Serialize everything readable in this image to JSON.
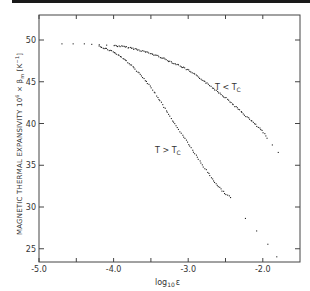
{
  "chart_data": {
    "type": "scatter",
    "title": "",
    "xlabel": "log10 ε",
    "ylabel": "MAGNETIC THERMAL EXPANSIVITY 10^6 × βm [K^-1]",
    "xlim": [
      -5.0,
      -1.5
    ],
    "ylim": [
      23.5,
      53
    ],
    "x_ticks": [
      -5.0,
      -4.5,
      -4.0,
      -3.5,
      -3.0,
      -2.5,
      -2.0
    ],
    "x_tick_labels": [
      "-5.0",
      "-4.0",
      "-3.0",
      "-2.0"
    ],
    "y_ticks": [
      25,
      30,
      35,
      40,
      45,
      50
    ],
    "y_tick_labels": [
      "25",
      "30",
      "35",
      "40",
      "45",
      "50"
    ],
    "grid": false,
    "legend": "inline annotations",
    "series": [
      {
        "name": "T < Tc",
        "label_pos": [
          -2.35,
          46.3
        ],
        "x": [
          -4.7,
          -4.55,
          -4.4,
          -4.3,
          -4.2,
          -4.1,
          -4.0,
          -3.9,
          -3.8,
          -3.7,
          -3.6,
          -3.5,
          -3.4,
          -3.3,
          -3.2,
          -3.1,
          -3.0,
          -2.9,
          -2.8,
          -2.7,
          -2.6,
          -2.5,
          -2.4,
          -2.3,
          -2.2,
          -2.1,
          -2.0,
          -1.95,
          -1.88,
          -1.8
        ],
        "y": [
          49.6,
          49.6,
          49.6,
          49.55,
          49.5,
          49.45,
          49.4,
          49.3,
          49.15,
          48.95,
          48.7,
          48.4,
          48.1,
          47.7,
          47.3,
          46.9,
          46.4,
          45.8,
          45.2,
          44.5,
          43.8,
          43.1,
          42.3,
          41.5,
          40.7,
          39.9,
          39.0,
          38.3,
          37.5,
          36.6
        ]
      },
      {
        "name": "T > Tc",
        "label_pos": [
          -3.28,
          38.7
        ],
        "x": [
          -4.2,
          -4.1,
          -4.0,
          -3.9,
          -3.8,
          -3.7,
          -3.6,
          -3.5,
          -3.4,
          -3.3,
          -3.2,
          -3.1,
          -3.0,
          -2.9,
          -2.8,
          -2.7,
          -2.6,
          -2.5,
          -2.44,
          -2.24,
          -2.09,
          -1.94,
          -1.82
        ],
        "y": [
          49.3,
          49.0,
          48.6,
          48.0,
          47.3,
          46.4,
          45.4,
          44.3,
          43.0,
          41.6,
          40.2,
          38.9,
          37.6,
          36.2,
          34.9,
          33.6,
          32.5,
          31.6,
          31.2,
          28.7,
          27.2,
          25.6,
          24.1
        ]
      }
    ]
  },
  "axes": {
    "x_title_main": "log",
    "x_title_sub": "10",
    "x_title_var": "ε",
    "y_title": "MAGNETIC  THERMAL  EXPANSIVITY  10",
    "y_title_exp": "6",
    "y_title_rest": " × β",
    "y_title_sub": "m",
    "y_title_unit": " [K",
    "y_title_unit_exp": "−1",
    "y_title_unit_close": "]"
  },
  "labels": {
    "below": "T < T",
    "below_sub": "C",
    "above": "T > T",
    "above_sub": "C"
  }
}
